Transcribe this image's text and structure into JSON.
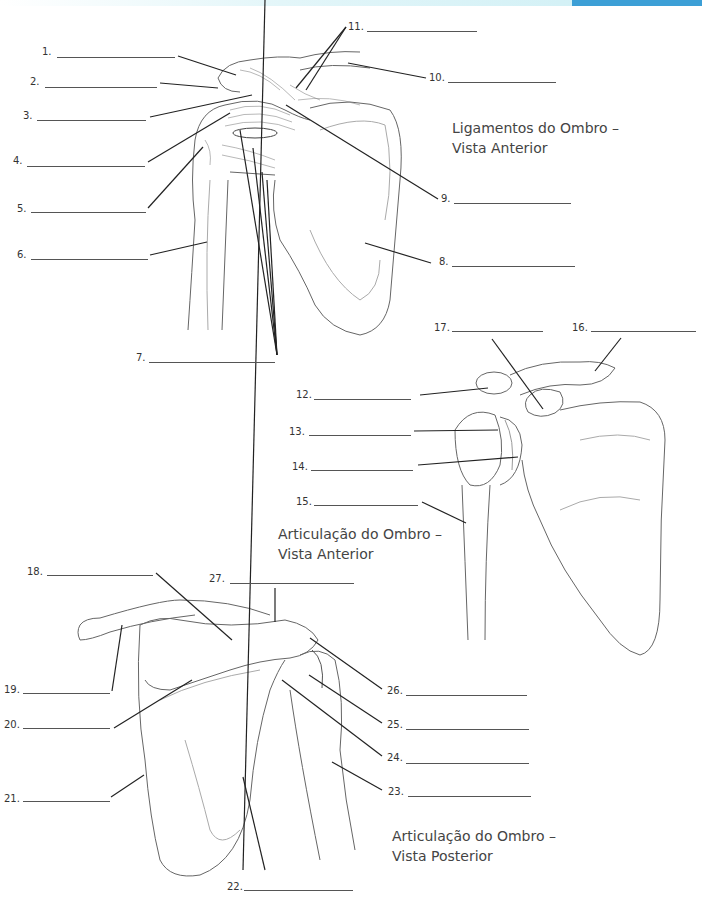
{
  "header": {
    "bar_color": "#d4f1f6",
    "accent_color": "#3c9fd6"
  },
  "figures": [
    {
      "id": "ligaments-anterior",
      "title_line1": "Ligamentos do Ombro –",
      "title_line2": "Vista Anterior"
    },
    {
      "id": "joint-anterior",
      "title_line1": "Articulação do Ombro –",
      "title_line2": "Vista Anterior"
    },
    {
      "id": "joint-posterior",
      "title_line1": "Articulação do Ombro –",
      "title_line2": "Vista Posterior"
    }
  ],
  "labels": [
    {
      "n": "1.",
      "answer": ""
    },
    {
      "n": "2.",
      "answer": ""
    },
    {
      "n": "3.",
      "answer": ""
    },
    {
      "n": "4.",
      "answer": ""
    },
    {
      "n": "5.",
      "answer": ""
    },
    {
      "n": "6.",
      "answer": ""
    },
    {
      "n": "7.",
      "answer": ""
    },
    {
      "n": "8.",
      "answer": ""
    },
    {
      "n": "9.",
      "answer": ""
    },
    {
      "n": "10.",
      "answer": ""
    },
    {
      "n": "11.",
      "answer": ""
    },
    {
      "n": "12.",
      "answer": ""
    },
    {
      "n": "13.",
      "answer": ""
    },
    {
      "n": "14.",
      "answer": ""
    },
    {
      "n": "15.",
      "answer": ""
    },
    {
      "n": "16.",
      "answer": ""
    },
    {
      "n": "17.",
      "answer": ""
    },
    {
      "n": "18.",
      "answer": ""
    },
    {
      "n": "19.",
      "answer": ""
    },
    {
      "n": "20.",
      "answer": ""
    },
    {
      "n": "21.",
      "answer": ""
    },
    {
      "n": "22.",
      "answer": ""
    },
    {
      "n": "23.",
      "answer": ""
    },
    {
      "n": "24.",
      "answer": ""
    },
    {
      "n": "25.",
      "answer": ""
    },
    {
      "n": "26.",
      "answer": ""
    },
    {
      "n": "27.",
      "answer": ""
    }
  ]
}
